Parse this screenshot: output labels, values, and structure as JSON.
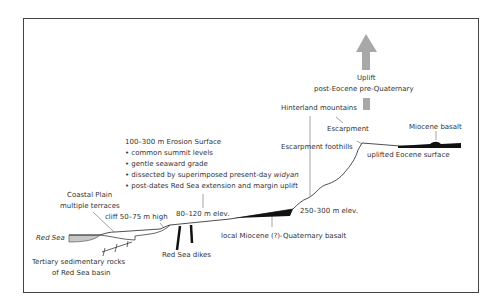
{
  "labels": {
    "uplift": "Uplift",
    "uplift_period": "post-Eocene pre-Quaternary",
    "hinterland": "Hinterland mountains",
    "escarpment": "Escarpment",
    "miocene_basalt": "Miocene basalt",
    "escarpment_foothills": "Escarpment foothills",
    "uplifted_surface": "uplifted Eocene surface",
    "erosion_title": "100–300 m Erosion Surface",
    "erosion_points": [
      "• common summit levels",
      "• gentle seaward grade",
      "• dissected by superimposed present-day ",
      "• post-dates Red Sea extension and margin uplift"
    ],
    "widyan": "widyan",
    "coastal_plain": "Coastal Plain",
    "multiple_terraces": "multiple terraces",
    "cliff": "cliff 50–75 m high",
    "elev_80_120": "80–120 m elev.",
    "elev_250_300": "250–300 m elev.",
    "red_sea": "Red Sea",
    "local_basalt": "local Miocene (?)-Quaternary basalt",
    "red_sea_dikes": "Red Sea dikes",
    "tertiary_1": "Tertiary sedimentary rocks",
    "tertiary_2": "of Red Sea basin"
  },
  "colors": {
    "frame": "#444444",
    "line": "#222222",
    "arrow": "#a8a8a8",
    "sea": "#c8c8c8",
    "basalt": "#111111"
  }
}
